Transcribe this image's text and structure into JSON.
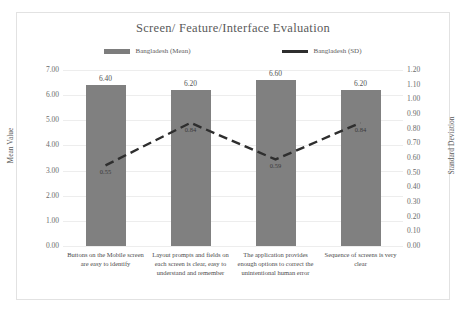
{
  "chart_data": {
    "type": "bar",
    "title": "Screen/ Feature/Interface  Evaluation",
    "categories": [
      "Buttons on the Mobile screen are easy to identify",
      "Layout prompts and fields on each screen is clear, easy to understand and remember",
      "The application provides enough options to correct the unintentional human error",
      "Sequence of screens is very clear"
    ],
    "series": [
      {
        "name": "Bangladesh (Mean)",
        "type": "bar",
        "axis": "left",
        "values": [
          6.4,
          6.2,
          6.6,
          6.2
        ],
        "labels": [
          "6.40",
          "6.20",
          "6.60",
          "6.20"
        ],
        "color": "#808080"
      },
      {
        "name": "Bangladesh (SD)",
        "type": "line",
        "axis": "right",
        "values": [
          0.55,
          0.84,
          0.59,
          0.84
        ],
        "labels": [
          "0.55",
          "0.84",
          "0.59",
          "0.84"
        ],
        "color": "#2e2e2e",
        "dashed": true
      }
    ],
    "xlabel": "",
    "ylabel": "Mean Value",
    "y2label": "Standard Deviation",
    "ylim": [
      0.0,
      7.0
    ],
    "y2lim": [
      0.0,
      1.2
    ],
    "yticks": [
      "0.00",
      "1.00",
      "2.00",
      "3.00",
      "4.00",
      "5.00",
      "6.00",
      "7.00"
    ],
    "y2ticks": [
      "0.00",
      "0.10",
      "0.20",
      "0.30",
      "0.40",
      "0.50",
      "0.60",
      "0.70",
      "0.80",
      "0.90",
      "1.00",
      "1.10",
      "1.20"
    ],
    "grid": true,
    "legend_position": "top"
  },
  "legend": {
    "items": [
      {
        "label": "Bangladesh (Mean)",
        "marker": "bar-swatch-icon"
      },
      {
        "label": "Bangladesh (SD)",
        "marker": "line-swatch-icon"
      }
    ]
  }
}
